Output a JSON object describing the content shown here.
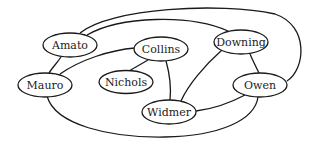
{
  "diagram": {
    "type": "undirected-graph",
    "nodes": [
      {
        "id": "amato",
        "label": "Amato"
      },
      {
        "id": "collins",
        "label": "Collins"
      },
      {
        "id": "downing",
        "label": "Downing"
      },
      {
        "id": "mauro",
        "label": "Mauro"
      },
      {
        "id": "nichols",
        "label": "Nichols"
      },
      {
        "id": "owen",
        "label": "Owen"
      },
      {
        "id": "widmer",
        "label": "Widmer"
      }
    ],
    "edges": [
      {
        "from": "Amato",
        "to": "Owen"
      },
      {
        "from": "Amato",
        "to": "Downing"
      },
      {
        "from": "Amato",
        "to": "Mauro"
      },
      {
        "from": "Mauro",
        "to": "Collins"
      },
      {
        "from": "Collins",
        "to": "Nichols"
      },
      {
        "from": "Collins",
        "to": "Widmer"
      },
      {
        "from": "Downing",
        "to": "Widmer"
      },
      {
        "from": "Downing",
        "to": "Owen"
      },
      {
        "from": "Widmer",
        "to": "Owen"
      },
      {
        "from": "Mauro",
        "to": "Owen"
      }
    ],
    "colors": {
      "stroke": "#1a1a1a",
      "node_fill": "#ffffff",
      "background": "#ffffff"
    }
  }
}
